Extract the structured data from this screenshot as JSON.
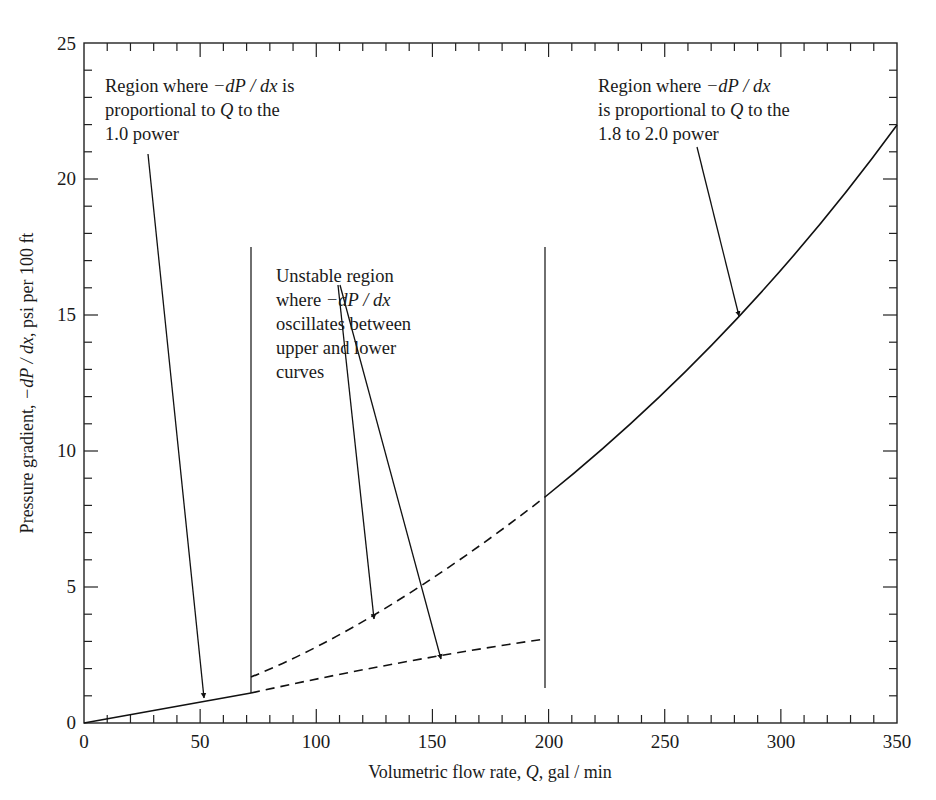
{
  "chart_data": {
    "type": "line",
    "title": "",
    "xlabel": "Volumetric flow rate, Q, gal / min",
    "ylabel": "Pressure gradient, −dP / dx, psi per 100 ft",
    "xlim": [
      0,
      350
    ],
    "ylim": [
      0,
      25
    ],
    "x_ticks": [
      0,
      50,
      100,
      150,
      200,
      250,
      300,
      350
    ],
    "y_ticks": [
      0,
      5,
      10,
      15,
      20,
      25
    ],
    "x_minor_step": 10,
    "y_minor_step": 1,
    "grid": false,
    "legend": null,
    "series": [
      {
        "name": "Laminar (solid)",
        "style": "solid",
        "x": [
          0,
          20,
          40,
          60,
          72
        ],
        "y": [
          0,
          0.3,
          0.6,
          0.9,
          1.1
        ]
      },
      {
        "name": "Unstable upper (dashed)",
        "style": "dashed",
        "x": [
          72,
          100,
          125,
          150,
          175,
          198
        ],
        "y": [
          1.7,
          2.8,
          3.9,
          5.3,
          6.7,
          8.3
        ]
      },
      {
        "name": "Unstable lower (dashed)",
        "style": "dashed",
        "x": [
          72,
          100,
          125,
          153,
          175,
          198
        ],
        "y": [
          1.1,
          1.6,
          2.0,
          2.4,
          2.75,
          3.1
        ]
      },
      {
        "name": "Turbulent (solid)",
        "style": "solid",
        "x": [
          198,
          225,
          250,
          280,
          300,
          325,
          350
        ],
        "y": [
          8.3,
          10.1,
          11.9,
          14.9,
          16.6,
          19.2,
          22.0
        ]
      }
    ],
    "vertical_lines": [
      {
        "x": 72,
        "y_from": 1.1,
        "y_to": 17.5
      },
      {
        "x": 198,
        "y_from": 1.3,
        "y_to": 17.5
      }
    ],
    "annotations": [
      {
        "id": "laminar",
        "lines": [
          "Region where −dP / dx is",
          "proportional to Q to the",
          "1.0 power"
        ],
        "arrow_from": [
          43,
          21.5
        ],
        "arrow_to": [
          52,
          0.8
        ]
      },
      {
        "id": "unstable",
        "lines": [
          "Unstable region",
          "where −dP / dx",
          "oscillates between",
          "upper and lower",
          "curves"
        ],
        "arrows": [
          {
            "from": [
              108,
              12.7
            ],
            "to": [
              125,
              3.9
            ]
          },
          {
            "from": [
              110,
              12.7
            ],
            "to": [
              153,
              2.4
            ]
          }
        ]
      },
      {
        "id": "turbulent",
        "lines": [
          "Region where −dP / dx",
          "is proportional to Q to the",
          "1.8 to 2.0 power"
        ],
        "arrow_from": [
          265,
          21.6
        ],
        "arrow_to": [
          280,
          14.9
        ]
      }
    ]
  },
  "labels": {
    "x_axis_title_pre": "Volumetric flow rate, ",
    "x_axis_title_var": "Q",
    "x_axis_title_post": ", gal / min",
    "y_axis_title_pre": "Pressure gradient, ",
    "y_axis_title_var": "−dP / dx",
    "y_axis_title_post": ", psi per 100 ft",
    "x_tick_0": "0",
    "x_tick_50": "50",
    "x_tick_100": "100",
    "x_tick_150": "150",
    "x_tick_200": "200",
    "x_tick_250": "250",
    "x_tick_300": "300",
    "x_tick_350": "350",
    "y_tick_0": "0",
    "y_tick_5": "5",
    "y_tick_10": "10",
    "y_tick_15": "15",
    "y_tick_20": "20",
    "y_tick_25": "25",
    "ann1_l1_pre": "Region where ",
    "ann1_l1_var": "−dP / dx",
    "ann1_l1_post": " is",
    "ann1_l2_pre": "proportional to ",
    "ann1_l2_var": "Q",
    "ann1_l2_post": " to the",
    "ann1_l3": "1.0 power",
    "ann2_l1": "Unstable region",
    "ann2_l2_pre": "where ",
    "ann2_l2_var": "−dP / dx",
    "ann2_l3": "oscillates between",
    "ann2_l4": "upper and lower",
    "ann2_l5": "curves",
    "ann3_l1_pre": "Region where ",
    "ann3_l1_var": "−dP / dx",
    "ann3_l2_pre": "is proportional to ",
    "ann3_l2_var": "Q",
    "ann3_l2_post": " to the",
    "ann3_l3": "1.8 to 2.0 power"
  }
}
